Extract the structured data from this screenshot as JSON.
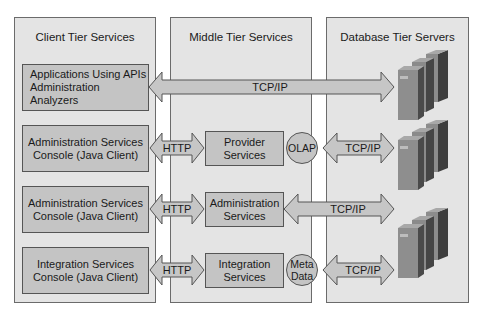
{
  "diagram": {
    "panels": [
      {
        "id": "client",
        "title": "Client Tier Services"
      },
      {
        "id": "middle",
        "title": "Middle Tier Services"
      },
      {
        "id": "database",
        "title": "Database Tier Servers"
      }
    ],
    "client_boxes": [
      {
        "label": "Applications Using APIs\nAdministration Analyzers"
      },
      {
        "label": "Administration Services\nConsole (Java Client)"
      },
      {
        "label": "Administration Services\nConsole (Java Client)"
      },
      {
        "label": "Integration Services\nConsole (Java Client)"
      }
    ],
    "middle_boxes": [
      {
        "label": "Provider\nServices"
      },
      {
        "label": "Administration\nServices"
      },
      {
        "label": "Integration\nServices"
      }
    ],
    "circles": [
      {
        "label": "OLAP"
      },
      {
        "label": "Meta\nData"
      }
    ],
    "arrows": {
      "row1": "TCP/IP",
      "http1": "HTTP",
      "http2": "HTTP",
      "http3": "HTTP",
      "tcp2": "TCP/IP",
      "tcp3": "TCP/IP",
      "tcp4": "TCP/IP"
    },
    "colors": {
      "panel_fill": "#e4e4e4",
      "box_fill": "#c4c4c4",
      "server_front": "#8a8a8a",
      "server_side": "#4a4a4a"
    }
  }
}
